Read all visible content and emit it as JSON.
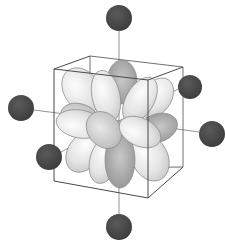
{
  "diagram": {
    "title": "",
    "description": "Octahedral ligand field: six ligands along Cartesian axes around a central metal with cubic frame and d-orbital lobes",
    "colors": {
      "ligand": "#4a4a4a",
      "lobe_light": "#eeeeee",
      "lobe_dark": "#9a9a9a",
      "cube_edge": "#555555",
      "axis_line": "#777777",
      "background": "#ffffff"
    },
    "ligands": [
      {
        "id": "top",
        "cx": 119,
        "cy": 18,
        "r": 13
      },
      {
        "id": "upper-right",
        "cx": 190,
        "cy": 87,
        "r": 12
      },
      {
        "id": "left",
        "cx": 21,
        "cy": 108,
        "r": 13
      },
      {
        "id": "right",
        "cx": 212,
        "cy": 134,
        "r": 13
      },
      {
        "id": "lower-left",
        "cx": 49,
        "cy": 157,
        "r": 13
      },
      {
        "id": "bottom",
        "cx": 119,
        "cy": 227,
        "r": 13
      }
    ],
    "center": {
      "x": 119,
      "y": 121
    },
    "cube": {
      "front": [
        [
          54,
          69
        ],
        [
          148,
          80
        ],
        [
          148,
          198
        ],
        [
          54,
          181
        ]
      ],
      "back_offset": [
        36,
        -13
      ]
    }
  }
}
